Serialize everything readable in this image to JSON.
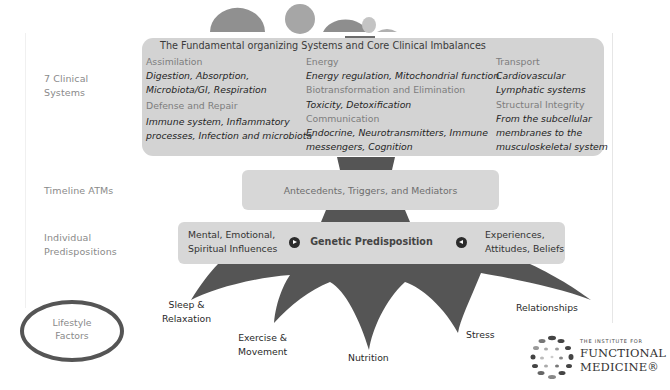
{
  "diagram": {
    "row_labels": {
      "clinical_systems": [
        "7 Clinical",
        "Systems"
      ],
      "timeline": "Timeline ATMs",
      "predispositions": [
        "Individual",
        "Predispositions"
      ],
      "lifestyle": [
        "Lifestyle",
        "Factors"
      ]
    },
    "systems_box": {
      "title": "The Fundamental organizing Systems and Core Clinical Imbalances",
      "columns": [
        {
          "groups": [
            {
              "category": "Assimilation",
              "items": [
                "Digestion, Absorption,",
                "Microbiota/GI, Respiration"
              ]
            },
            {
              "category": "Defense and Repair",
              "items": [
                "Immune system, Inflammatory",
                "processes, Infection and microbiota"
              ]
            }
          ]
        },
        {
          "groups": [
            {
              "category": "Energy",
              "items": [
                "Energy regulation, Mitochondrial function"
              ]
            },
            {
              "category": "Biotransformation and Elimination",
              "items": [
                "Toxicity, Detoxification"
              ]
            },
            {
              "category": "Communication",
              "items": [
                "Endocrine, Neurotransmitters, Immune",
                "messengers, Cognition"
              ]
            }
          ]
        },
        {
          "groups": [
            {
              "category": "Transport",
              "items": [
                "Cardiovascular",
                "Lymphatic systems"
              ]
            },
            {
              "category": "Structural Integrity",
              "items": [
                "From the subcellular",
                "membranes to the",
                "musculoskeletal system"
              ]
            }
          ]
        }
      ]
    },
    "atm_box": {
      "label": "Antecedents, Triggers, and Mediators"
    },
    "predisposition_box": {
      "left": [
        "Mental, Emotional,",
        "Spiritual Influences"
      ],
      "center": "Genetic Predisposition",
      "right": [
        "Experiences,",
        "Attitudes, Beliefs"
      ],
      "left_arrow_icon": "arrow-right-circle-icon",
      "right_arrow_icon": "arrow-left-circle-icon"
    },
    "lifestyle_factors": [
      {
        "lines": [
          "Sleep &",
          "Relaxation"
        ]
      },
      {
        "lines": [
          "Exercise &",
          "Movement"
        ]
      },
      {
        "lines": [
          "Nutrition"
        ]
      },
      {
        "lines": [
          "Stress"
        ]
      },
      {
        "lines": [
          "Relationships"
        ]
      }
    ],
    "logo": {
      "tagline": "THE INSTITUTE FOR",
      "line1": "FUNCTIONAL",
      "line2": "MEDICINE®"
    },
    "colors": {
      "box_fill": "#d3d3d3",
      "trunk": "#555555",
      "label_gray": "#8a8a8a",
      "leaf_gray": "#9a9a9a"
    }
  }
}
